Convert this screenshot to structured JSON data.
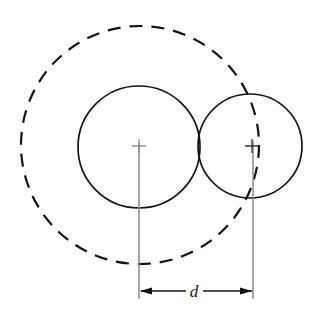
{
  "figure": {
    "background_color": "#ffffff",
    "canvas": {
      "width": 333,
      "height": 317
    },
    "dimension_label": "d"
  },
  "colors": {
    "solid_line": "#141414",
    "dashed_line": "#141414",
    "extension_line": "#8a8a8a",
    "dimension_line": "#141414",
    "center_mark": "#8a8a8a",
    "text": "#141414"
  },
  "shapes": {
    "dashed_circle": {
      "name": "construction-circle",
      "style": "dashed",
      "center_x": 140,
      "center_y": 145,
      "radius": 119,
      "stroke_width": 2.2,
      "dash_pattern": "13 9"
    },
    "left_circle": {
      "name": "left-circle",
      "style": "solid",
      "center_x": 139,
      "center_y": 147,
      "radius": 61,
      "stroke_width": 1.7
    },
    "right_circle": {
      "name": "right-circle",
      "style": "solid",
      "center_x": 250,
      "center_y": 146,
      "radius": 52,
      "stroke_width": 1.7
    }
  },
  "center_marks": {
    "left": {
      "x": 139,
      "y": 146,
      "arm": 7
    },
    "right": {
      "x": 252,
      "y": 146,
      "arm": 7
    }
  },
  "dimension": {
    "label": "d",
    "label_x": 194,
    "label_y": 297,
    "line_y": 291,
    "left_x": 139,
    "right_x": 253,
    "extension_top_left_y": 143,
    "extension_top_right_y": 141,
    "extension_bottom_y": 299,
    "arrow_length": 12,
    "arrow_half_width": 3.6,
    "value": 114
  },
  "chart_data": {
    "type": "diagram",
    "elements": [
      {
        "kind": "circle",
        "name": "construction-circle",
        "linestyle": "dashed",
        "cx": 140,
        "cy": 145,
        "r": 119
      },
      {
        "kind": "circle",
        "name": "left-circle",
        "linestyle": "solid",
        "cx": 139,
        "cy": 147,
        "r": 61
      },
      {
        "kind": "circle",
        "name": "right-circle",
        "linestyle": "solid",
        "cx": 250,
        "cy": 146,
        "r": 52
      },
      {
        "kind": "center-mark",
        "name": "left-center-mark",
        "cx": 139,
        "cy": 146
      },
      {
        "kind": "center-mark",
        "name": "right-center-mark",
        "cx": 252,
        "cy": 146
      },
      {
        "kind": "dimension",
        "name": "center-distance",
        "label": "d",
        "from_x": 139,
        "to_x": 253,
        "y": 291
      }
    ],
    "annotations": [
      "d"
    ]
  }
}
